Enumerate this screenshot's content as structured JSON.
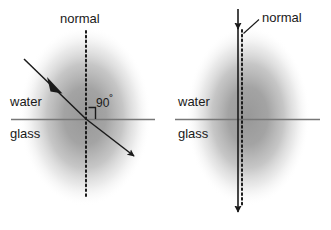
{
  "figure": {
    "title_visible": false,
    "background_color": "#ffffff",
    "ink_color": "#1a1a1a",
    "interface_line_color": "#808080",
    "blob_color": "#9a9a9a"
  },
  "diagrams": [
    {
      "id": "left-refraction",
      "name": "oblique-incidence-refraction",
      "labels": {
        "normal": "normal",
        "upper_medium": "water",
        "lower_medium": "glass",
        "angle": "90",
        "angle_unit": "˚"
      },
      "geometry": {
        "blob_center_x": 85,
        "blob_center_y": 115,
        "interface_y": 119,
        "interface_x_start": 11,
        "interface_x_end": 155,
        "normal_x": 86,
        "normal_y_top": 31,
        "normal_y_bottom": 198,
        "incident_start": [
          24,
          59
        ],
        "incident_end": [
          86,
          119
        ],
        "refracted_start": [
          86,
          119
        ],
        "refracted_end": [
          139,
          160
        ],
        "right_angle_marker": [
          92,
          105
        ]
      }
    },
    {
      "id": "right-normal-incidence",
      "name": "normal-incidence-no-refraction",
      "labels": {
        "normal": "normal",
        "upper_medium": "water",
        "lower_medium": "glass"
      },
      "geometry": {
        "blob_center_x": 248,
        "blob_center_y": 115,
        "interface_y": 119,
        "interface_x_start": 175,
        "interface_x_end": 320,
        "ray_x": 238,
        "ray_y_top": 8,
        "ray_y_bottom": 222,
        "normal_dotted_x": 242,
        "normal_dotted_y_top": 30,
        "normal_dotted_y_bottom": 210,
        "leader_start": [
          259,
          20
        ],
        "leader_end": [
          243,
          34
        ]
      }
    }
  ]
}
